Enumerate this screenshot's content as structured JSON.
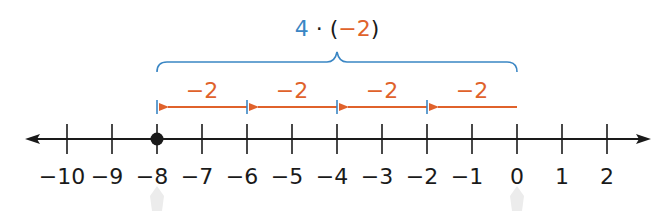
{
  "expression": {
    "factor": "4",
    "dot": "·",
    "open_paren": "(",
    "negative_value": "−2",
    "close_paren": ")"
  },
  "steps": [
    {
      "label": "−2",
      "from": 0,
      "to": -2
    },
    {
      "label": "−2",
      "from": -2,
      "to": -4
    },
    {
      "label": "−2",
      "from": -4,
      "to": -6
    },
    {
      "label": "−2",
      "from": -6,
      "to": -8
    }
  ],
  "number_line": {
    "min": -10,
    "max": 2,
    "tick_labels": [
      "−10",
      "−9",
      "−8",
      "−7",
      "−6",
      "−5",
      "−4",
      "−3",
      "−2",
      "−1",
      "0",
      "1",
      "2"
    ],
    "highlighted_point": -8
  },
  "colors": {
    "blue": "#3a86c4",
    "orange": "#e0622b",
    "black": "#1a1a1a"
  }
}
